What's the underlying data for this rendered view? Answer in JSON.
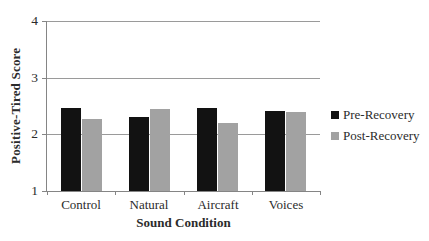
{
  "chart_data": {
    "type": "bar",
    "title": "",
    "xlabel": "Sound Condition",
    "ylabel": "Positive-Tired Score",
    "categories": [
      "Control",
      "Natural",
      "Aircraft",
      "Voices"
    ],
    "series": [
      {
        "name": "Pre-Recovery",
        "color": "#121212",
        "values": [
          2.46,
          2.31,
          2.47,
          2.41
        ]
      },
      {
        "name": "Post-Recovery",
        "color": "#a2a2a2",
        "values": [
          2.27,
          2.44,
          2.2,
          2.4
        ]
      }
    ],
    "ylim": [
      1,
      4
    ],
    "yticks": [
      1,
      2,
      3,
      4
    ],
    "grid": "horizontal gridlines at y = 2, 3, 4",
    "legend_position": "right"
  },
  "colors": {
    "axis": "#858585",
    "gridline": "#9a9a9a",
    "text": "#2b2b2b",
    "background": "#ffffff"
  }
}
